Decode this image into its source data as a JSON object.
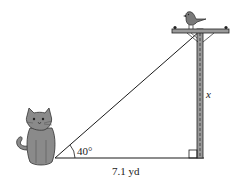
{
  "diagram": {
    "type": "right-triangle word problem",
    "angle_label": "40°",
    "base_label": "7.1 yd",
    "height_label": "x",
    "right_angle_marker": true,
    "figures": {
      "observer": "cat",
      "target": "bird",
      "structure": "utility pole"
    },
    "colors": {
      "line": "#1a1a1a",
      "cat_fill": "#8a8a8a",
      "pole_fill": "#9a9a9a",
      "bird_fill": "#7a7a7a"
    }
  }
}
